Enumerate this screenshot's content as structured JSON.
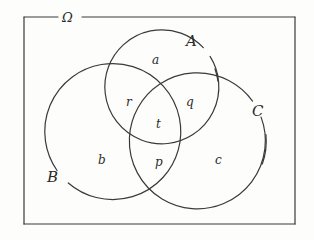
{
  "figure": {
    "type": "venn-diagram",
    "stroke_color": "#3a3a3a",
    "background_color": "#fdfdfc",
    "text_color": "#2b2b2b"
  },
  "universe": {
    "label": "Ω"
  },
  "sets": [
    {
      "key": "A",
      "label": "A",
      "cx": 161,
      "cy": 88,
      "r": 57
    },
    {
      "key": "B",
      "label": "B",
      "cx": 120,
      "cy": 144,
      "r": 68
    },
    {
      "key": "C",
      "label": "C",
      "cx": 200,
      "cy": 144,
      "r": 68
    }
  ],
  "regions": [
    {
      "key": "a",
      "label": "a",
      "meaning": "A only"
    },
    {
      "key": "r",
      "label": "r",
      "meaning": "A and B only"
    },
    {
      "key": "q",
      "label": "q",
      "meaning": "A and C only"
    },
    {
      "key": "t",
      "label": "t",
      "meaning": "A and B and C"
    },
    {
      "key": "b",
      "label": "b",
      "meaning": "B only"
    },
    {
      "key": "p",
      "label": "p",
      "meaning": "B and C only"
    },
    {
      "key": "c",
      "label": "c",
      "meaning": "C only"
    }
  ]
}
